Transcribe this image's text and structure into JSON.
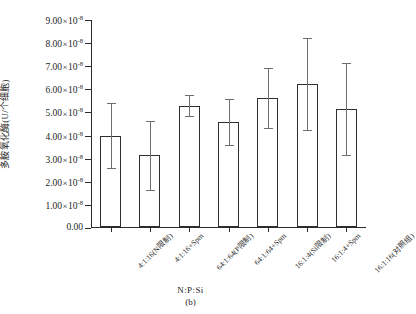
{
  "chart_data": {
    "type": "bar",
    "title": "",
    "panel_label": "(b)",
    "xlabel": "N:P:Si",
    "ylabel": "多胺氧化酶(U/个细胞)",
    "categories": [
      "4:1:16(N限制)",
      "4:1:16+Spm",
      "64:1:64(P限制)",
      "64:1:64+Spm",
      "16:1:4(Si限制)",
      "16:1:4+Spm",
      "16:1:16(对照组)"
    ],
    "values": [
      3.95,
      3.1,
      5.25,
      4.55,
      5.6,
      6.2,
      5.1
    ],
    "errors": [
      1.4,
      1.5,
      0.45,
      1.0,
      1.3,
      2.0,
      2.0
    ],
    "value_scale": "1e-8",
    "value_unit": "U/个细胞",
    "ylim": [
      0.0,
      9.0
    ],
    "ytick_values": [
      0.0,
      1.0,
      2.0,
      3.0,
      4.0,
      5.0,
      6.0,
      7.0,
      8.0,
      9.0
    ],
    "ytick_labels": [
      "0.00",
      "1.00×10",
      "2.00×10",
      "3.00×10",
      "4.00×10",
      "5.00×10",
      "6.00×10",
      "7.00×10",
      "8.00×10",
      "9.00×10"
    ],
    "ytick_exponent": "-8",
    "grid": false,
    "legend": false,
    "bar_facecolor": "#ffffff",
    "bar_edgecolor": "#2e2e2e",
    "errorbar_color": "#6e6e6e",
    "axis_color": "#2b2b2b"
  }
}
